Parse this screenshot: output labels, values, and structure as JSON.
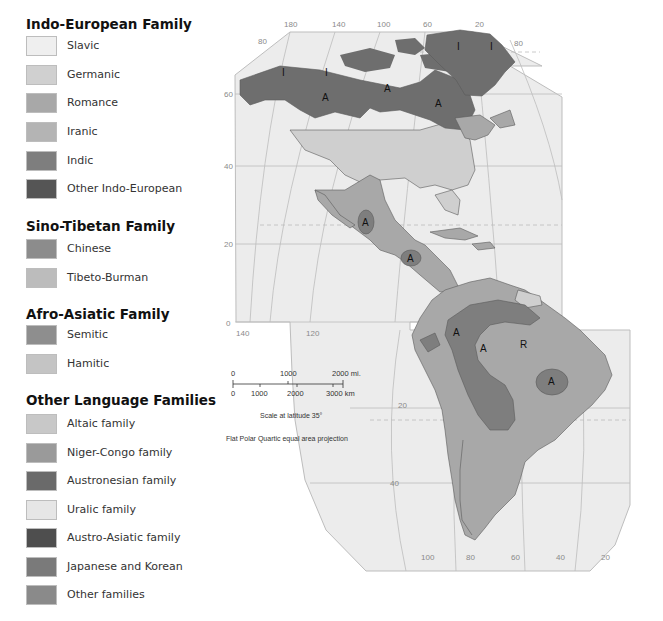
{
  "legend": {
    "cut_title": "Languages",
    "groups": [
      {
        "title": "Indo-European Family",
        "items": [
          {
            "label": "Slavic",
            "color": "#efefef"
          },
          {
            "label": "Germanic",
            "color": "#d0d0d0"
          },
          {
            "label": "Romance",
            "color": "#a8a8a8"
          },
          {
            "label": "Iranic",
            "color": "#b4b4b4"
          },
          {
            "label": "Indic",
            "color": "#7e7e7e"
          },
          {
            "label": "Other Indo-European",
            "color": "#555555"
          }
        ]
      },
      {
        "title": "Sino-Tibetan Family",
        "items": [
          {
            "label": "Chinese",
            "color": "#8c8c8c"
          },
          {
            "label": "Tibeto-Burman",
            "color": "#bcbcbc"
          }
        ]
      },
      {
        "title": "Afro-Asiatic Family",
        "items": [
          {
            "label": "Semitic",
            "color": "#8e8e8e"
          },
          {
            "label": "Hamitic",
            "color": "#c4c4c4"
          }
        ]
      },
      {
        "title": "Other Language Families",
        "items": [
          {
            "label": "Altaic family",
            "color": "#c8c8c8"
          },
          {
            "label": "Niger-Congo family",
            "color": "#9a9a9a"
          },
          {
            "label": "Austronesian family",
            "color": "#6a6a6a"
          },
          {
            "label": "Uralic family",
            "color": "#e6e6e6"
          },
          {
            "label": "Austro-Asiatic family",
            "color": "#4e4e4e"
          },
          {
            "label": "Japanese and Korean",
            "color": "#7a7a7a"
          },
          {
            "label": "Other families",
            "color": "#8a8a8a"
          }
        ]
      }
    ]
  },
  "map": {
    "longitude_labels_top": [
      "180",
      "140",
      "100",
      "60",
      "20"
    ],
    "latitude_labels_top": [
      "80",
      "80"
    ],
    "latitude_labels_left": [
      "60",
      "40",
      "20",
      "0"
    ],
    "longitude_labels_mid": [
      "140",
      "120"
    ],
    "latitude_labels_south": [
      "20",
      "40"
    ],
    "longitude_labels_bottom": [
      "100",
      "80",
      "60",
      "40",
      "20"
    ],
    "region_labels": [
      "I",
      "I",
      "A",
      "A",
      "A",
      "I",
      "I",
      "A",
      "A",
      "A",
      "A",
      "R",
      "A"
    ],
    "colors": {
      "ocean": "#ececec",
      "romance": "#a8a8a8",
      "germanic": "#cfcfcf",
      "amerindian": "#7e7e7e",
      "inuit": "#6e6e6e",
      "graticule": "#bdbdbd",
      "border": "#5a5a5a"
    }
  },
  "scale": {
    "mi_labels": [
      "0",
      "1000",
      "2000 mi."
    ],
    "km_labels": [
      "0",
      "1000",
      "2000",
      "3000 km"
    ],
    "latitude_note": "Scale at latitude 35°",
    "projection_note": "Flat Polar Quartic equal area projection"
  }
}
